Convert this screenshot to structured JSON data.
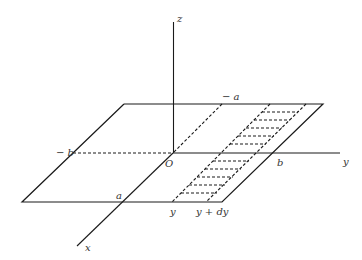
{
  "diagram": {
    "axes": {
      "x": {
        "label": "x"
      },
      "y": {
        "label": "y"
      },
      "z": {
        "label": "z"
      }
    },
    "origin": {
      "label": "O"
    },
    "points": {
      "neg_a": "− a",
      "neg_b": "− b",
      "a": "a",
      "b": "b",
      "y": "y",
      "y_dy": "y + dy"
    }
  }
}
